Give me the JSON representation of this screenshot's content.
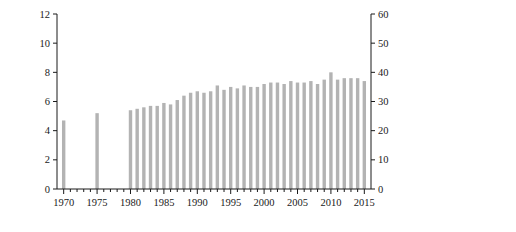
{
  "chart_data": {
    "type": "line",
    "title": "",
    "xlabel": "(年)",
    "ylabel": "産出額(兆円)",
    "y2label": "割合 (%)",
    "xlim": [
      1969,
      2016
    ],
    "ylim": [
      0,
      12
    ],
    "y2lim": [
      0,
      60
    ],
    "grid": false,
    "legend_position": "right",
    "xticks": [
      1970,
      1975,
      1980,
      1985,
      1990,
      1995,
      2000,
      2005,
      2010,
      2015
    ],
    "xtick_labels": [
      "1970",
      "1975",
      "1980",
      "1985",
      "1990",
      "1995",
      "2000",
      "2005",
      "2010",
      "2015"
    ],
    "xtick_minor_step": 1,
    "yticks": [
      0,
      2,
      4,
      6,
      8,
      10,
      12
    ],
    "ytick_labels": [
      "0",
      "2",
      "4",
      "6",
      "8",
      "10",
      "12"
    ],
    "y2ticks": [
      0,
      10,
      20,
      30,
      40,
      50,
      60
    ],
    "y2tick_labels": [
      "0",
      "10",
      "20",
      "30",
      "40",
      "50",
      "60"
    ],
    "x": [
      1970,
      1971,
      1972,
      1973,
      1974,
      1975,
      1976,
      1977,
      1978,
      1979,
      1980,
      1981,
      1982,
      1983,
      1984,
      1985,
      1986,
      1987,
      1988,
      1989,
      1990,
      1991,
      1992,
      1993,
      1994,
      1995,
      1996,
      1997,
      1998,
      1999,
      2000,
      2001,
      2002,
      2003,
      2004,
      2005,
      2006,
      2007,
      2008,
      2009,
      2010,
      2011,
      2012,
      2013,
      2014,
      2015
    ],
    "series": [
      {
        "name": "割合(%)",
        "key": "ratio",
        "type": "bar",
        "axis": "right",
        "unit": "%",
        "color": "#b3b3b3",
        "values": [
          23.5,
          null,
          null,
          null,
          null,
          26.0,
          null,
          null,
          null,
          null,
          27.0,
          27.5,
          28.0,
          28.5,
          28.5,
          29.5,
          29.0,
          30.5,
          32.0,
          33.0,
          33.5,
          33.0,
          33.5,
          35.5,
          34.0,
          35.0,
          34.5,
          35.5,
          35.0,
          35.0,
          36.0,
          36.5,
          36.5,
          36.0,
          37.0,
          36.5,
          36.5,
          37.0,
          36.0,
          37.5,
          40.0,
          37.5,
          38.0,
          38.0,
          38.0,
          37.0
        ]
      },
      {
        "name": "農業総産出額",
        "key": "total",
        "type": "line",
        "axis": "left",
        "marker": "open-square",
        "unit": "兆円",
        "color": "#444444",
        "values": [
          4.8,
          null,
          null,
          null,
          null,
          9.1,
          null,
          null,
          null,
          null,
          10.3,
          10.6,
          10.9,
          11.0,
          11.8,
          11.6,
          11.3,
          10.6,
          10.8,
          11.2,
          11.5,
          11.0,
          11.4,
          10.4,
          11.3,
          10.5,
          10.6,
          10.2,
          9.9,
          9.6,
          9.1,
          8.9,
          8.9,
          8.9,
          8.8,
          8.5,
          8.3,
          8.2,
          8.5,
          8.2,
          8.1,
          8.2,
          8.5,
          8.5,
          8.4,
          8.8
        ]
      },
      {
        "name": "園芸作物産出額",
        "key": "horticulture",
        "type": "line",
        "axis": "left",
        "marker": "filled-circle",
        "unit": "兆円",
        "color": "#111111",
        "values": [
          1.1,
          null,
          null,
          null,
          null,
          2.3,
          null,
          null,
          null,
          null,
          3.2,
          3.1,
          3.2,
          3.2,
          3.3,
          3.3,
          3.2,
          3.2,
          3.3,
          3.4,
          3.6,
          3.9,
          4.2,
          3.7,
          4.0,
          3.6,
          3.7,
          3.6,
          3.6,
          3.5,
          3.5,
          3.4,
          3.5,
          3.4,
          4.1,
          3.5,
          3.4,
          3.4,
          3.4,
          3.3,
          3.4,
          3.4,
          3.5,
          3.5,
          3.5,
          3.7
        ]
      },
      {
        "name": "米産出額",
        "key": "rice",
        "type": "line",
        "axis": "left",
        "marker": "open-diamond",
        "unit": "兆円",
        "color": "#333333",
        "values": [
          1.9,
          null,
          null,
          null,
          null,
          3.6,
          null,
          null,
          null,
          null,
          3.3,
          3.2,
          3.5,
          3.7,
          3.9,
          3.9,
          3.9,
          3.4,
          3.2,
          3.2,
          3.2,
          3.0,
          3.1,
          2.6,
          3.5,
          3.1,
          2.8,
          2.7,
          2.5,
          2.3,
          2.3,
          2.1,
          2.1,
          2.1,
          1.9,
          1.9,
          1.7,
          1.6,
          1.9,
          1.8,
          1.6,
          1.8,
          2.0,
          1.8,
          1.5,
          1.4
        ]
      },
      {
        "name": "畜産産出額",
        "key": "livestock",
        "type": "line",
        "axis": "left",
        "marker": "filled-triangle",
        "unit": "兆円",
        "color": "#111111",
        "values": [
          1.2,
          null,
          null,
          null,
          null,
          2.2,
          null,
          null,
          null,
          null,
          3.2,
          3.1,
          3.1,
          3.1,
          3.1,
          3.2,
          3.2,
          3.1,
          3.0,
          3.0,
          3.1,
          3.0,
          3.0,
          2.8,
          2.8,
          2.6,
          2.6,
          2.6,
          2.6,
          2.6,
          2.6,
          2.5,
          2.6,
          2.6,
          2.6,
          2.6,
          2.6,
          2.6,
          2.7,
          2.6,
          2.6,
          2.6,
          2.7,
          2.8,
          3.0,
          3.5
        ]
      }
    ]
  },
  "legend": {
    "items": [
      {
        "label": "割合(%)",
        "marker": "bar",
        "color": "#b3b3b3"
      },
      {
        "label": "農業総産出額",
        "marker": "open-square",
        "color": "#444444"
      },
      {
        "label": "園芸作物産出額",
        "marker": "filled-circle",
        "color": "#111111"
      },
      {
        "label": "米産出額",
        "marker": "open-diamond",
        "color": "#333333"
      },
      {
        "label": "畜産産出額",
        "marker": "filled-triangle",
        "color": "#111111"
      }
    ]
  },
  "axes": {
    "left_title": "産出額(兆円)",
    "right_title": "割合 (%)",
    "x_unit": "(年)"
  },
  "colors": {
    "bar": "#b3b3b3",
    "line": "#1a1a1a",
    "axis": "#1a1a1a",
    "background": "#ffffff"
  }
}
